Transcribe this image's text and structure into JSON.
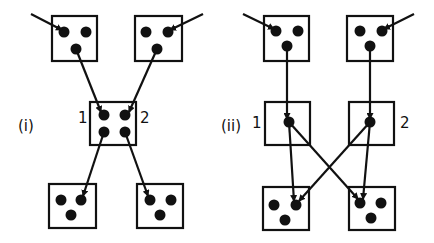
{
  "colors": {
    "stroke": "#111111",
    "dot": "#111111",
    "background": "#ffffff"
  },
  "panels": [
    {
      "label": "(i)",
      "label_pos": [
        18,
        131
      ],
      "boxes": [
        {
          "id": "top-left",
          "x": 52,
          "y": 16,
          "w": 45,
          "h": 45,
          "dots": [
            [
              64,
              32
            ],
            [
              86,
              32
            ],
            [
              76,
              49
            ]
          ]
        },
        {
          "id": "top-right",
          "x": 135,
          "y": 16,
          "w": 47,
          "h": 45,
          "dots": [
            [
              146,
              32
            ],
            [
              168,
              32
            ],
            [
              157,
              49
            ]
          ]
        },
        {
          "id": "middle",
          "x": 90,
          "y": 102,
          "w": 46,
          "h": 43,
          "dots": [
            [
              104,
              115
            ],
            [
              125,
              115
            ],
            [
              104,
              132
            ],
            [
              125,
              132
            ]
          ]
        },
        {
          "id": "bottom-left",
          "x": 49,
          "y": 184,
          "w": 47,
          "h": 44,
          "dots": [
            [
              61,
              200
            ],
            [
              81,
              200
            ],
            [
              71,
              215
            ]
          ]
        },
        {
          "id": "bottom-right",
          "x": 137,
          "y": 184,
          "w": 46,
          "h": 44,
          "dots": [
            [
              150,
              200
            ],
            [
              171,
              200
            ],
            [
              160,
              215
            ]
          ]
        }
      ],
      "node_labels": [
        {
          "text": "1",
          "x": 78,
          "y": 123
        },
        {
          "text": "2",
          "x": 140,
          "y": 123
        }
      ],
      "arrows": [
        {
          "from": [
            31,
            14
          ],
          "to": [
            62,
            30
          ],
          "head": true
        },
        {
          "from": [
            203,
            14
          ],
          "to": [
            170,
            30
          ],
          "head": true
        },
        {
          "from": [
            76,
            49
          ],
          "to": [
            101,
            112
          ],
          "head": true
        },
        {
          "from": [
            157,
            49
          ],
          "to": [
            129,
            112
          ],
          "head": true
        },
        {
          "from": [
            104,
            132
          ],
          "to": [
            83,
            196
          ],
          "head": true
        },
        {
          "from": [
            125,
            132
          ],
          "to": [
            148,
            196
          ],
          "head": true
        }
      ]
    },
    {
      "label": "(ii)",
      "label_pos": [
        221,
        131
      ],
      "boxes": [
        {
          "id": "top-left",
          "x": 264,
          "y": 16,
          "w": 45,
          "h": 45,
          "dots": [
            [
              276,
              31
            ],
            [
              298,
              31
            ],
            [
              287,
              46
            ]
          ]
        },
        {
          "id": "top-right",
          "x": 347,
          "y": 16,
          "w": 46,
          "h": 45,
          "dots": [
            [
              360,
              31
            ],
            [
              382,
              31
            ],
            [
              370,
              46
            ]
          ]
        },
        {
          "id": "middle-left",
          "x": 265,
          "y": 102,
          "w": 45,
          "h": 43,
          "dots": [
            [
              289,
              122
            ]
          ]
        },
        {
          "id": "middle-right",
          "x": 349,
          "y": 102,
          "w": 45,
          "h": 43,
          "dots": [
            [
              370,
              122
            ]
          ]
        },
        {
          "id": "bottom-left",
          "x": 263,
          "y": 187,
          "w": 46,
          "h": 43,
          "dots": [
            [
              274,
              205
            ],
            [
              296,
              205
            ],
            [
              285,
              220
            ]
          ]
        },
        {
          "id": "bottom-right",
          "x": 349,
          "y": 187,
          "w": 46,
          "h": 43,
          "dots": [
            [
              360,
              203
            ],
            [
              381,
              203
            ],
            [
              371,
              218
            ]
          ]
        }
      ],
      "node_labels": [
        {
          "text": "1",
          "x": 252,
          "y": 128
        },
        {
          "text": "2",
          "x": 400,
          "y": 128
        }
      ],
      "arrows": [
        {
          "from": [
            243,
            14
          ],
          "to": [
            274,
            29
          ],
          "head": true
        },
        {
          "from": [
            414,
            14
          ],
          "to": [
            384,
            29
          ],
          "head": true
        },
        {
          "from": [
            287,
            46
          ],
          "to": [
            287,
            119
          ],
          "head": true
        },
        {
          "from": [
            370,
            46
          ],
          "to": [
            370,
            119
          ],
          "head": true
        },
        {
          "from": [
            289,
            122
          ],
          "to": [
            294,
            201
          ],
          "head": true
        },
        {
          "from": [
            289,
            122
          ],
          "to": [
            358,
            199
          ],
          "head": true
        },
        {
          "from": [
            370,
            122
          ],
          "to": [
            299,
            201
          ],
          "head": true
        },
        {
          "from": [
            370,
            122
          ],
          "to": [
            363,
            199
          ],
          "head": true
        }
      ]
    }
  ]
}
